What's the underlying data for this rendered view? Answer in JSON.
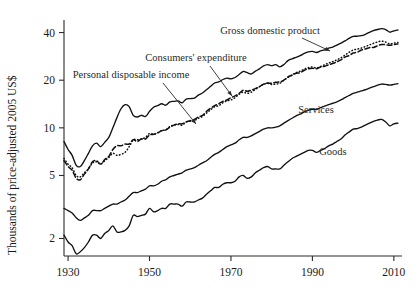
{
  "chart_data": {
    "type": "line",
    "title": "",
    "subtitle": "",
    "xlabel": "",
    "ylabel": "Thousands of price-adjusted 2005 US$",
    "yscale": "log",
    "xlim": [
      1929,
      2012
    ],
    "ylim": [
      1.55,
      48
    ],
    "grid": false,
    "legend_position": "inline-annotations",
    "xticks": [
      1930,
      1950,
      1970,
      1990,
      2010
    ],
    "xtick_labels": [
      "1930",
      "1950",
      "1970",
      "1990",
      "2010"
    ],
    "yticks": [
      2,
      5,
      10,
      20,
      40
    ],
    "ytick_labels": [
      "2",
      "5",
      "10",
      "20",
      "40"
    ],
    "annotations": [
      {
        "text": "Gross domestic product",
        "series": "Gross domestic product",
        "x": 270,
        "y": 34
      },
      {
        "text": "Consumers' expenditure",
        "series": "Consumers' expenditure",
        "x": 196,
        "y": 61
      },
      {
        "text": "Personal disposable income",
        "series": "Personal disposable income",
        "x": 131,
        "y": 78
      },
      {
        "text": "Services",
        "series": "Services",
        "x": 316,
        "y": 113
      },
      {
        "text": "Goods",
        "series": "Goods",
        "x": 333,
        "y": 155
      }
    ],
    "x": [
      1929,
      1930,
      1931,
      1932,
      1933,
      1934,
      1935,
      1936,
      1937,
      1938,
      1939,
      1940,
      1941,
      1942,
      1943,
      1944,
      1945,
      1946,
      1947,
      1948,
      1949,
      1950,
      1951,
      1952,
      1953,
      1954,
      1955,
      1956,
      1957,
      1958,
      1959,
      1960,
      1961,
      1962,
      1963,
      1964,
      1965,
      1966,
      1967,
      1968,
      1969,
      1970,
      1971,
      1972,
      1973,
      1974,
      1975,
      1976,
      1977,
      1978,
      1979,
      1980,
      1981,
      1982,
      1983,
      1984,
      1985,
      1986,
      1987,
      1988,
      1989,
      1990,
      1991,
      1992,
      1993,
      1994,
      1995,
      1996,
      1997,
      1998,
      1999,
      2000,
      2001,
      2002,
      2003,
      2004,
      2005,
      2006,
      2007,
      2008,
      2009,
      2010,
      2011
    ],
    "series": [
      {
        "name": "Gross domestic product",
        "style": "solid",
        "values": [
          8.2,
          7.3,
          6.7,
          5.8,
          5.7,
          6.2,
          6.9,
          7.7,
          8.0,
          7.6,
          8.1,
          8.7,
          10.0,
          11.6,
          13.2,
          14.0,
          13.6,
          12.0,
          11.7,
          12.0,
          11.8,
          12.7,
          13.5,
          13.8,
          14.2,
          13.9,
          14.6,
          14.7,
          14.8,
          14.4,
          15.2,
          15.3,
          15.4,
          16.1,
          16.6,
          17.4,
          18.3,
          19.2,
          19.5,
          20.2,
          20.6,
          20.4,
          20.8,
          21.7,
          22.7,
          22.3,
          21.9,
          22.8,
          23.6,
          24.6,
          25.1,
          24.7,
          25.1,
          24.3,
          25.1,
          26.6,
          27.3,
          27.9,
          28.6,
          29.5,
          30.2,
          30.4,
          29.9,
          30.6,
          31.1,
          31.9,
          32.4,
          33.3,
          34.3,
          35.4,
          36.7,
          37.8,
          37.9,
          38.2,
          39.0,
          40.1,
          41.1,
          41.8,
          42.3,
          41.8,
          40.2,
          41.0,
          41.5
        ]
      },
      {
        "name": "Consumers' expenditure",
        "style": "dotted",
        "values": [
          6.4,
          5.9,
          5.6,
          5.0,
          4.9,
          5.2,
          5.5,
          6.0,
          6.1,
          5.9,
          6.2,
          6.5,
          6.9,
          6.7,
          6.8,
          7.0,
          7.6,
          8.4,
          8.4,
          8.5,
          8.7,
          9.2,
          9.1,
          9.3,
          9.6,
          9.7,
          10.2,
          10.4,
          10.5,
          10.4,
          10.9,
          11.0,
          11.1,
          11.5,
          11.8,
          12.4,
          13.0,
          13.6,
          13.8,
          14.4,
          14.8,
          15.0,
          15.5,
          16.3,
          16.8,
          16.5,
          16.8,
          17.5,
          18.2,
          18.8,
          19.1,
          18.8,
          18.9,
          19.1,
          20.0,
          20.8,
          21.6,
          22.3,
          22.8,
          23.5,
          24.0,
          24.2,
          23.9,
          24.4,
          25.0,
          25.7,
          26.2,
          26.9,
          27.7,
          28.8,
          30.0,
          31.0,
          31.4,
          31.9,
          32.6,
          33.4,
          34.2,
          34.9,
          35.3,
          34.8,
          33.9,
          34.3,
          34.6
        ]
      },
      {
        "name": "Personal disposable income",
        "style": "dashed",
        "values": [
          6.2,
          5.7,
          5.4,
          4.8,
          4.7,
          5.1,
          5.5,
          6.1,
          6.2,
          5.9,
          6.3,
          6.6,
          7.3,
          7.7,
          7.7,
          7.9,
          7.9,
          8.4,
          8.2,
          8.5,
          8.5,
          9.0,
          9.1,
          9.3,
          9.6,
          9.7,
          10.1,
          10.4,
          10.6,
          10.6,
          10.9,
          11.1,
          11.3,
          11.7,
          12.0,
          12.7,
          13.3,
          13.8,
          14.2,
          14.7,
          15.0,
          15.5,
          15.9,
          16.5,
          17.3,
          17.0,
          17.3,
          17.7,
          18.2,
          18.9,
          19.2,
          19.1,
          19.4,
          19.5,
          20.0,
          21.0,
          21.5,
          22.1,
          22.3,
          23.1,
          23.6,
          23.8,
          23.6,
          24.2,
          24.5,
          25.0,
          25.5,
          26.1,
          26.9,
          28.0,
          28.6,
          29.7,
          30.0,
          31.0,
          31.5,
          32.1,
          32.2,
          33.0,
          33.6,
          33.5,
          33.2,
          33.6,
          33.9
        ]
      },
      {
        "name": "Services",
        "style": "solid",
        "values": [
          3.1,
          3.0,
          2.9,
          2.7,
          2.6,
          2.7,
          2.8,
          3.0,
          3.0,
          3.0,
          3.1,
          3.2,
          3.3,
          3.3,
          3.4,
          3.5,
          3.7,
          3.9,
          3.9,
          4.0,
          4.1,
          4.3,
          4.3,
          4.4,
          4.6,
          4.7,
          4.9,
          5.0,
          5.1,
          5.2,
          5.4,
          5.5,
          5.6,
          5.8,
          6.0,
          6.2,
          6.5,
          6.8,
          7.0,
          7.3,
          7.6,
          7.8,
          8.0,
          8.4,
          8.7,
          8.7,
          8.9,
          9.2,
          9.5,
          9.8,
          10.0,
          10.0,
          10.1,
          10.3,
          10.7,
          11.1,
          11.5,
          11.9,
          12.2,
          12.6,
          12.9,
          13.1,
          13.1,
          13.4,
          13.7,
          14.0,
          14.3,
          14.6,
          15.0,
          15.5,
          16.0,
          16.5,
          16.8,
          17.1,
          17.4,
          17.8,
          18.2,
          18.6,
          18.9,
          18.8,
          18.6,
          18.8,
          19.0
        ]
      },
      {
        "name": "Goods",
        "style": "solid",
        "values": [
          2.1,
          1.9,
          1.8,
          1.6,
          1.65,
          1.75,
          1.9,
          2.1,
          2.1,
          2.0,
          2.15,
          2.25,
          2.4,
          2.2,
          2.2,
          2.25,
          2.4,
          2.8,
          2.75,
          2.8,
          2.85,
          3.1,
          2.95,
          3.0,
          3.1,
          3.1,
          3.3,
          3.3,
          3.3,
          3.2,
          3.4,
          3.4,
          3.4,
          3.5,
          3.6,
          3.8,
          4.0,
          4.2,
          4.2,
          4.4,
          4.5,
          4.5,
          4.6,
          4.9,
          5.0,
          4.8,
          4.9,
          5.2,
          5.4,
          5.6,
          5.7,
          5.5,
          5.5,
          5.5,
          5.8,
          6.1,
          6.4,
          6.6,
          6.8,
          7.0,
          7.2,
          7.2,
          7.0,
          7.2,
          7.4,
          7.7,
          7.9,
          8.2,
          8.5,
          9.0,
          9.4,
          9.8,
          9.9,
          10.1,
          10.4,
          10.7,
          11.0,
          11.2,
          11.3,
          10.9,
          10.3,
          10.6,
          10.7
        ]
      }
    ]
  },
  "axis": {
    "y_title": "Thousands of price-adjusted 2005 US$"
  }
}
